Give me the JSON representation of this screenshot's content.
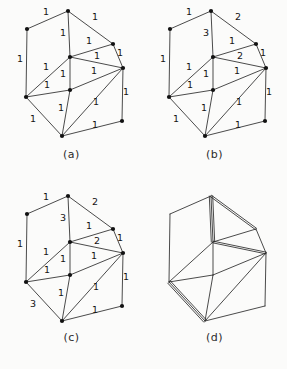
{
  "figure": {
    "title": "",
    "background_color": "#fbfbfa",
    "line_color": "#2a2a2a",
    "vertex_color": "#111111",
    "label_color": "#141414"
  },
  "panels": [
    {
      "id": "a",
      "caption": "(a)"
    },
    {
      "id": "b",
      "caption": "(b)"
    },
    {
      "id": "c",
      "caption": "(c)"
    },
    {
      "id": "d",
      "caption": "(d)"
    }
  ],
  "graph": {
    "vertices": [
      {
        "id": "TL",
        "name": "top-left",
        "x": 27,
        "y": 29
      },
      {
        "id": "T",
        "name": "top",
        "x": 68,
        "y": 11
      },
      {
        "id": "RU",
        "name": "right-upper",
        "x": 113,
        "y": 44
      },
      {
        "id": "C",
        "name": "center",
        "x": 70,
        "y": 57
      },
      {
        "id": "FR",
        "name": "far-right",
        "x": 123,
        "y": 68
      },
      {
        "id": "L",
        "name": "left",
        "x": 26,
        "y": 97
      },
      {
        "id": "M",
        "name": "middle",
        "x": 70,
        "y": 90
      },
      {
        "id": "B",
        "name": "bottom",
        "x": 62,
        "y": 136
      },
      {
        "id": "BR",
        "name": "bottom-right",
        "x": 122,
        "y": 121
      }
    ],
    "edges": [
      {
        "id": "TL-T",
        "from": "TL",
        "to": "T",
        "lx": 46,
        "ly": 15
      },
      {
        "id": "T-RU",
        "from": "T",
        "to": "RU",
        "lx": 95,
        "ly": 20
      },
      {
        "id": "TL-L",
        "from": "TL",
        "to": "L",
        "lx": 20,
        "ly": 62
      },
      {
        "id": "T-C",
        "from": "T",
        "to": "C",
        "lx": 63,
        "ly": 36
      },
      {
        "id": "C-RU",
        "from": "C",
        "to": "RU",
        "lx": 89,
        "ly": 44
      },
      {
        "id": "RU-FR",
        "from": "RU",
        "to": "FR",
        "lx": 120,
        "ly": 56
      },
      {
        "id": "C-FR",
        "from": "C",
        "to": "FR",
        "lx": 97,
        "ly": 59
      },
      {
        "id": "C-L",
        "from": "C",
        "to": "L",
        "lx": 46,
        "ly": 70
      },
      {
        "id": "C-M",
        "from": "C",
        "to": "M",
        "lx": 63,
        "ly": 77
      },
      {
        "id": "M-FR",
        "from": "M",
        "to": "FR",
        "lx": 94,
        "ly": 74
      },
      {
        "id": "L-M",
        "from": "L",
        "to": "M",
        "lx": 47,
        "ly": 88
      },
      {
        "id": "L-B",
        "from": "L",
        "to": "B",
        "lx": 33,
        "ly": 122
      },
      {
        "id": "M-B",
        "from": "M",
        "to": "B",
        "lx": 61,
        "ly": 111
      },
      {
        "id": "B-FR",
        "from": "B",
        "to": "FR",
        "lx": 96,
        "ly": 105
      },
      {
        "id": "B-BR",
        "from": "B",
        "to": "BR",
        "lx": 95,
        "ly": 128
      },
      {
        "id": "BR-FR",
        "from": "BR",
        "to": "FR",
        "lx": 126,
        "ly": 95
      }
    ]
  },
  "weights": {
    "a": {
      "TL-T": "1",
      "T-RU": "1",
      "TL-L": "1",
      "T-C": "1",
      "C-RU": "1",
      "RU-FR": "1",
      "C-FR": "1",
      "C-L": "1",
      "C-M": "1",
      "M-FR": "1",
      "L-M": "1",
      "L-B": "1",
      "M-B": "1",
      "B-FR": "1",
      "B-BR": "1",
      "BR-FR": "1"
    },
    "b": {
      "TL-T": "1",
      "T-RU": "2",
      "TL-L": "1",
      "T-C": "3",
      "C-RU": "1",
      "RU-FR": "1",
      "C-FR": "2",
      "C-L": "1",
      "C-M": "1",
      "M-FR": "1",
      "L-M": "1",
      "L-B": "1",
      "M-B": "1",
      "B-FR": "1",
      "B-BR": "1",
      "BR-FR": "1"
    },
    "c": {
      "TL-T": "1",
      "T-RU": "2",
      "TL-L": "1",
      "T-C": "3",
      "C-RU": "1",
      "RU-FR": "1",
      "C-FR": "2",
      "C-L": "1",
      "C-M": "1",
      "M-FR": "1",
      "L-M": "1",
      "L-B": "3",
      "M-B": "1",
      "B-FR": "1",
      "B-BR": "1",
      "BR-FR": "1"
    },
    "d": {
      "TL-T": 1,
      "T-RU": 2,
      "TL-L": 1,
      "T-C": 3,
      "C-RU": 1,
      "RU-FR": 1,
      "C-FR": 2,
      "C-L": 1,
      "C-M": 1,
      "M-FR": 1,
      "L-M": 1,
      "L-B": 3,
      "M-B": 1,
      "B-FR": 1,
      "B-BR": 1,
      "BR-FR": 1
    }
  }
}
